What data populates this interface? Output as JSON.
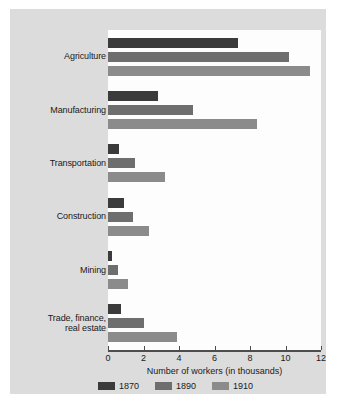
{
  "chart_data": {
    "type": "bar",
    "orientation": "horizontal",
    "title": "",
    "xlabel": "Number of workers (in thousands)",
    "ylabel": "",
    "xlim": [
      0,
      12
    ],
    "xticks": [
      0,
      2,
      4,
      6,
      8,
      10,
      12
    ],
    "xtick_labels": [
      "0",
      "2",
      "4",
      "6",
      "8",
      "10",
      "12"
    ],
    "grid": false,
    "legend_position": "bottom",
    "categories": [
      "Agriculture",
      "Manufacturing",
      "Transportation",
      "Construction",
      "Mining",
      "Trade, finance, real estate"
    ],
    "series": [
      {
        "name": "1870",
        "color": "#3b3b3b",
        "values": [
          7.3,
          2.8,
          0.6,
          0.9,
          0.2,
          0.75
        ]
      },
      {
        "name": "1890",
        "color": "#6e6e6e",
        "values": [
          10.2,
          4.8,
          1.5,
          1.4,
          0.55,
          2.0
        ]
      },
      {
        "name": "1910",
        "color": "#8b8b8b",
        "values": [
          11.4,
          8.4,
          3.2,
          2.3,
          1.1,
          3.9
        ]
      }
    ]
  },
  "labels": {
    "categories": [
      {
        "line1": "Agriculture",
        "line2": ""
      },
      {
        "line1": "Manufacturing",
        "line2": ""
      },
      {
        "line1": "Transportation",
        "line2": ""
      },
      {
        "line1": "Construction",
        "line2": ""
      },
      {
        "line1": "Mining",
        "line2": ""
      },
      {
        "line1": "Trade, finance,",
        "line2": "real estate"
      }
    ]
  },
  "legend": {
    "items": [
      {
        "label": "1870",
        "color": "#3b3b3b"
      },
      {
        "label": "1890",
        "color": "#6e6e6e"
      },
      {
        "label": "1910",
        "color": "#8b8b8b"
      }
    ]
  },
  "colors": {
    "page_background": "#ffffff",
    "card_background": "#dcdcdc",
    "plot_background": "#fdfdfd",
    "axis": "#4d4d4d",
    "text": "#1a1a1a"
  }
}
